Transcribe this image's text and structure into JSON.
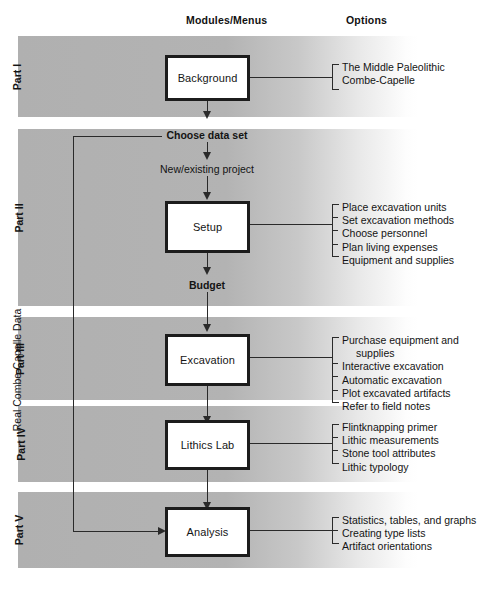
{
  "headers": {
    "modules": "Modules/Menus",
    "options": "Options"
  },
  "side_label": "Real Combe-Capelle Data",
  "parts": [
    {
      "label": "Part I"
    },
    {
      "label": "Part II"
    },
    {
      "label": "Part III"
    },
    {
      "label": "Part IV"
    },
    {
      "label": "Part V"
    }
  ],
  "modules": [
    {
      "name": "Background"
    },
    {
      "name": "Setup"
    },
    {
      "name": "Excavation"
    },
    {
      "name": "Lithics Lab"
    },
    {
      "name": "Analysis"
    }
  ],
  "flow_labels": {
    "choose_data_set": "Choose data set",
    "new_existing_project": "New/existing project",
    "budget": "Budget"
  },
  "options": {
    "background": [
      "The Middle Paleolithic",
      "Combe-Capelle"
    ],
    "setup": [
      "Place excavation units",
      "Set excavation methods",
      "Choose personnel",
      "Plan living expenses",
      "Equipment and supplies"
    ],
    "excavation": [
      "Purchase equipment and",
      "supplies",
      "Interactive excavation",
      "Automatic excavation",
      "Plot excavated artifacts",
      "Refer to field notes"
    ],
    "lithics_lab": [
      "Flintknapping primer",
      "Lithic measurements",
      "Stone tool attributes",
      "Lithic typology"
    ],
    "analysis": [
      "Statistics, tables, and graphs",
      "Creating type lists",
      "Artifact orientations"
    ]
  },
  "colors": {
    "band_gray": "#b2b2b2",
    "box_border": "#1c1c1c",
    "box_fill": "#ffffff",
    "line": "#2a2a2a",
    "text": "#141414"
  }
}
